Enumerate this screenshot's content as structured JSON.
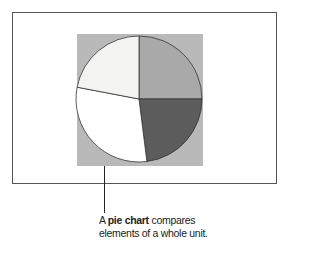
{
  "caption": {
    "prefix": "A ",
    "bold_term": "pie chart",
    "line1_suffix": " compares",
    "line2": "elements of a whole unit."
  },
  "colors": {
    "frame_border": "#555555",
    "chart_background": "#b9b9b9",
    "slice_outline": "#333333"
  },
  "chart_data": {
    "type": "pie",
    "title": "",
    "labels": [
      "Slice A",
      "Slice B",
      "Slice C",
      "Slice D"
    ],
    "values": [
      25,
      23,
      30,
      22
    ],
    "colors": [
      "#a9a9a9",
      "#5c5c5c",
      "#ffffff",
      "#f3f3f1"
    ],
    "start_angle_deg": 0,
    "direction": "clockwise",
    "legend": "none",
    "center": [
      139,
      99
    ],
    "radius": 63,
    "background_box": {
      "x": 77,
      "y": 34,
      "width": 126,
      "height": 132
    }
  }
}
